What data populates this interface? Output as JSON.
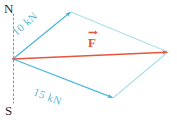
{
  "diagram": {
    "compass": {
      "north_label": "N",
      "south_label": "S",
      "axis_style": "dotted",
      "axis_color": "#9a9a9a"
    },
    "colors": {
      "vector_blue": "#4bb8dd",
      "parallelogram_light": "#aadff0",
      "resultant_red": "#e4573c",
      "label_blue": "#5bb8d4",
      "text_dark": "#2b2b2b"
    },
    "origin": {
      "x": 13,
      "y": 59
    },
    "vectors": [
      {
        "name": "force-10kn",
        "label": "10 kN",
        "magnitude": 10,
        "unit": "kN",
        "from": {
          "x": 13,
          "y": 59
        },
        "to": {
          "x": 71,
          "y": 12
        },
        "color": "#4bb8dd",
        "arrowhead": true
      },
      {
        "name": "force-15kn",
        "label": "15 kN",
        "magnitude": 15,
        "unit": "kN",
        "from": {
          "x": 13,
          "y": 59
        },
        "to": {
          "x": 113,
          "y": 98
        },
        "color": "#4bb8dd",
        "arrowhead": true
      },
      {
        "name": "resultant-f",
        "label": "F",
        "from": {
          "x": 13,
          "y": 59
        },
        "to": {
          "x": 168,
          "y": 52
        },
        "color": "#e4573c",
        "arrowhead": true
      }
    ],
    "parallelogram_sides": [
      {
        "name": "side-top-right",
        "from": {
          "x": 71,
          "y": 12
        },
        "to": {
          "x": 168,
          "y": 52
        }
      },
      {
        "name": "side-bottom-right",
        "from": {
          "x": 113,
          "y": 98
        },
        "to": {
          "x": 168,
          "y": 52
        }
      }
    ]
  }
}
